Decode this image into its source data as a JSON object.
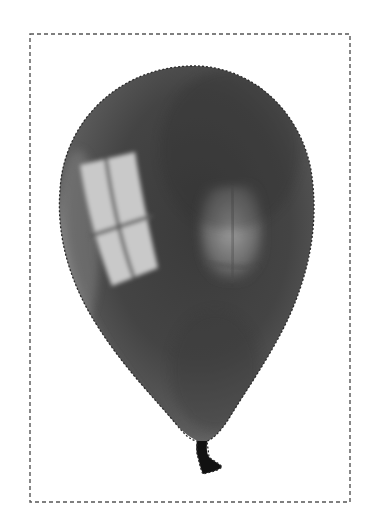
{
  "figure": {
    "colors": {
      "background": "#ffffff",
      "balloon_dark": "#3f3f3f",
      "balloon_mid": "#5a5a5a",
      "balloon_edge_light": "#8a8a8a",
      "window_highlight": "#c8c8c8",
      "knot": "#111111",
      "dash": "#555555"
    },
    "selection": {
      "type": "marching-ants",
      "bounding_rect": {
        "x": 30,
        "y": 34,
        "width": 320,
        "height": 468
      }
    }
  }
}
